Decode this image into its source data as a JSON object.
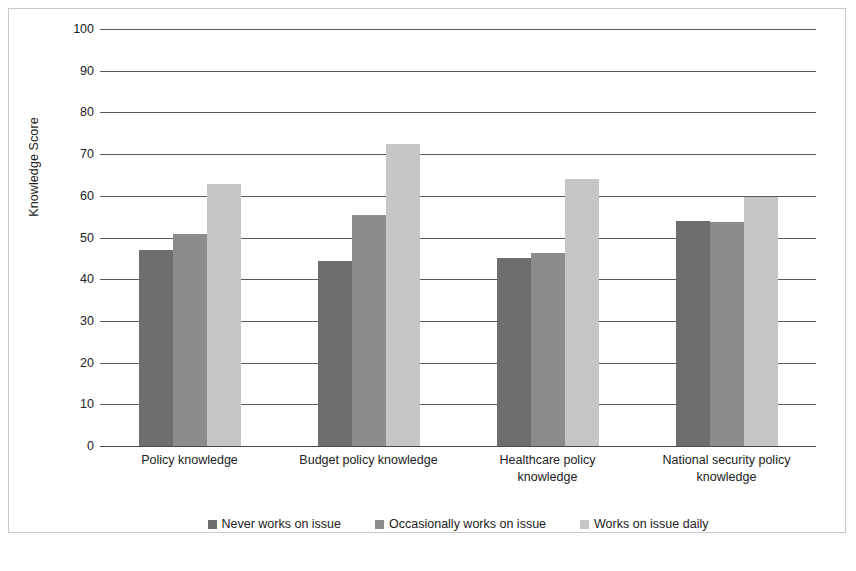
{
  "chart_data": {
    "type": "bar",
    "title": "",
    "xlabel": "",
    "ylabel": "Knowledge Score",
    "ylim": [
      0,
      100
    ],
    "ytick_step": 10,
    "grid": "horizontal",
    "legend_position": "bottom",
    "categories": [
      "Policy knowledge",
      "Budget policy knowledge",
      "Healthcare policy knowledge",
      "National security policy knowledge"
    ],
    "ytick_labels": [
      "100",
      "90",
      "80",
      "70",
      "60",
      "50",
      "40",
      "30",
      "20",
      "10",
      "0"
    ],
    "ytick_values": [
      100,
      90,
      80,
      70,
      60,
      50,
      40,
      30,
      20,
      10,
      0
    ],
    "series": [
      {
        "name": "Never works on issue",
        "color": "#6e6e6e",
        "values": [
          47,
          44.3,
          45.2,
          54
        ]
      },
      {
        "name": "Occasionally works on issue",
        "color": "#8c8c8c",
        "values": [
          50.8,
          55.4,
          46.3,
          53.8
        ]
      },
      {
        "name": "Works on issue daily",
        "color": "#c6c6c6",
        "values": [
          62.8,
          72.4,
          64.1,
          59.7
        ]
      }
    ]
  },
  "axis": {
    "y_title": "Knowledge Score"
  },
  "legend": {
    "items": [
      {
        "label": "Never works on issue",
        "color": "#6e6e6e"
      },
      {
        "label": "Occasionally works on issue",
        "color": "#8c8c8c"
      },
      {
        "label": "Works on issue daily",
        "color": "#c6c6c6"
      }
    ]
  },
  "category_labels": [
    {
      "line1": "Policy knowledge",
      "line2": ""
    },
    {
      "line1": "Budget policy knowledge",
      "line2": ""
    },
    {
      "line1": "Healthcare policy",
      "line2": "knowledge"
    },
    {
      "line1": "National security policy",
      "line2": "knowledge"
    }
  ]
}
